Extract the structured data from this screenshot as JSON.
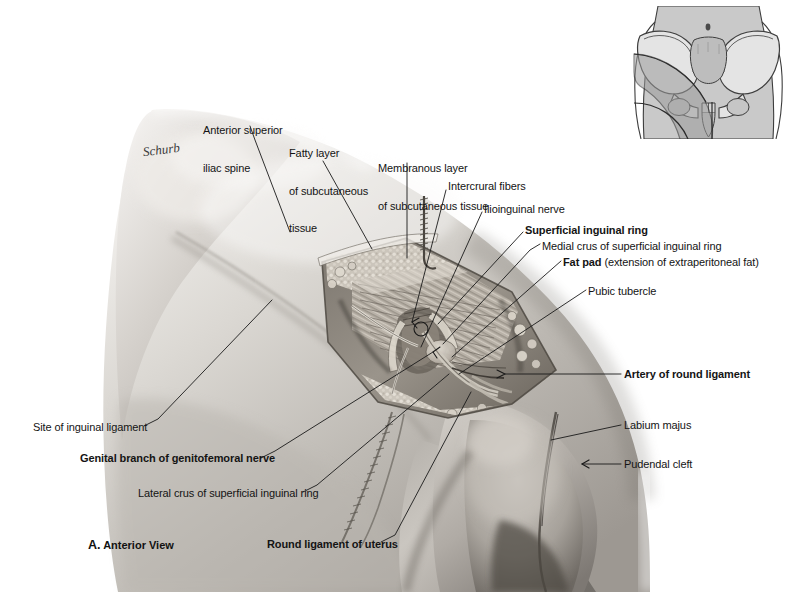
{
  "plate": {
    "width": 802,
    "height": 592,
    "background": "#ffffff",
    "figure_caption_letter": "A.",
    "figure_caption_text": " Anterior View",
    "artist_signature": "Schurb"
  },
  "labels": [
    {
      "id": "anterior-superior-iliac-spine",
      "lines": [
        "Anterior superior",
        "iliac spine"
      ],
      "bold": false,
      "x": 203,
      "y": 99,
      "align": "left",
      "leader": [
        [
          252,
          127
        ],
        [
          268,
          143
        ],
        [
          290,
          230
        ]
      ]
    },
    {
      "id": "fatty-layer-of-subcutaneous-tissue",
      "lines": [
        "Fatty layer",
        "of subcutaneous",
        "tissue"
      ],
      "bold": false,
      "x": 289,
      "y": 122,
      "align": "left",
      "leader": [
        [
          330,
          162
        ],
        [
          372,
          247
        ]
      ]
    },
    {
      "id": "membranous-layer-of-subcutaneous-tissue",
      "lines": [
        "Membranous layer",
        "of subcutaneous tissue"
      ],
      "bold": false,
      "x": 378,
      "y": 137,
      "align": "left",
      "leader": [
        [
          407,
          163
        ],
        [
          407,
          255
        ]
      ]
    },
    {
      "id": "intercrural-fibers",
      "lines": [
        "Intercrural fibers"
      ],
      "bold": false,
      "x": 448,
      "y": 180,
      "align": "left",
      "leader": [
        [
          445,
          190
        ],
        [
          413,
          320
        ]
      ]
    },
    {
      "id": "ilioinguinal-nerve",
      "lines": [
        "Ilioinguinal nerve"
      ],
      "bold": false,
      "x": 484,
      "y": 203,
      "align": "left",
      "leader": [
        [
          481,
          212
        ],
        [
          420,
          345
        ]
      ]
    },
    {
      "id": "superficial-inguinal-ring",
      "lines": [
        "Superficial inguinal ring"
      ],
      "bold": true,
      "x": 525,
      "y": 224,
      "align": "left",
      "leader": [
        [
          522,
          233
        ],
        [
          437,
          325
        ]
      ]
    },
    {
      "id": "medial-crus-of-superficial-inguinal-ring",
      "lines": [
        "Medial crus of superficial inguinal ring"
      ],
      "bold": false,
      "x": 542,
      "y": 240,
      "align": "left",
      "leader": [
        [
          538,
          246
        ],
        [
          441,
          344
        ]
      ]
    },
    {
      "id": "fat-pad",
      "bold_prefix": "Fat pad",
      "rest": " (extension of extraperitoneal fat)",
      "lines": [
        "Fat pad (extension of extraperitoneal fat)"
      ],
      "bold": false,
      "x": 563,
      "y": 256,
      "align": "left",
      "leader": [
        [
          559,
          262
        ],
        [
          452,
          355
        ]
      ]
    },
    {
      "id": "pubic-tubercle",
      "lines": [
        "Pubic tubercle"
      ],
      "bold": false,
      "x": 588,
      "y": 285,
      "align": "left",
      "leader": [
        [
          584,
          291
        ],
        [
          460,
          372
        ]
      ]
    },
    {
      "id": "artery-of-round-ligament",
      "lines": [
        "Artery of round ligament"
      ],
      "bold": true,
      "x": 624,
      "y": 370,
      "align": "left",
      "leader": [
        [
          620,
          375
        ],
        [
          500,
          375
        ]
      ]
    },
    {
      "id": "labium-majus",
      "lines": [
        "Labium majus"
      ],
      "bold": false,
      "x": 624,
      "y": 420,
      "align": "left",
      "leader": [
        [
          620,
          426
        ],
        [
          551,
          438
        ]
      ]
    },
    {
      "id": "pudendal-cleft",
      "lines": [
        "Pudendal cleft"
      ],
      "bold": false,
      "x": 624,
      "y": 459,
      "align": "left",
      "leader": [
        [
          620,
          465
        ],
        [
          578,
          465
        ]
      ],
      "arrow": true
    },
    {
      "id": "site-of-inguinal-ligament",
      "lines": [
        "Site of inguinal ligament"
      ],
      "bold": false,
      "x": 33,
      "y": 425,
      "align": "left",
      "leader": [
        [
          146,
          427
        ],
        [
          160,
          420
        ],
        [
          270,
          300
        ]
      ]
    },
    {
      "id": "genital-branch-of-genitofemoral-nerve",
      "lines": [
        "Genital branch of genitofemoral nerve"
      ],
      "bold": true,
      "x": 80,
      "y": 456,
      "align": "left",
      "leader": [
        [
          262,
          459
        ],
        [
          278,
          452
        ],
        [
          432,
          350
        ]
      ]
    },
    {
      "id": "lateral-crus-of-superficial-inguinal-ring",
      "lines": [
        "Lateral crus of superficial inguinal ring"
      ],
      "bold": false,
      "x": 138,
      "y": 491,
      "align": "left",
      "leader": [
        [
          304,
          493
        ],
        [
          320,
          487
        ],
        [
          448,
          372
        ]
      ]
    },
    {
      "id": "round-ligament-of-uterus",
      "lines": [
        "Round ligament of uterus"
      ],
      "bold": true,
      "x": 267,
      "y": 542,
      "align": "left",
      "leader": [
        [
          382,
          543
        ],
        [
          398,
          536
        ],
        [
          470,
          390
        ]
      ]
    }
  ],
  "inset": {
    "name": "orientation-pelvis-diagram",
    "description": "Anterior pelvis with shaded region indicating area of dissection",
    "body_fill": "#c9c9c9",
    "bone_fill": "#e2e2e2",
    "shade_fill": "#a8a8a8",
    "outline": "#3a3a3a",
    "umbilicus": true
  },
  "colors": {
    "background": "#ffffff",
    "text": "#141414",
    "leader_line": "#1a1a1a",
    "skin_light": "#e9e7e4",
    "skin_mid": "#c2bfba",
    "skin_dark": "#8f8b86",
    "tissue_dark": "#5a5650",
    "muscle": "#b4aea6"
  }
}
